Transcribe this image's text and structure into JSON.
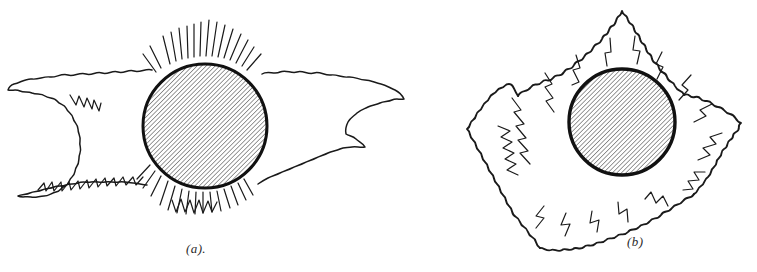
{
  "figure": {
    "background_color": "#ffffff",
    "ink_color": "#1a1a1a",
    "panels": [
      {
        "id": "a",
        "caption": "(a).",
        "disk": {
          "label": "hatched solar disk",
          "center_x": 205,
          "center_y": 126,
          "radius": 63,
          "hatch_angle_deg": 45,
          "hatch_spacing_px": 3,
          "fill_description": "diagonal line hatching"
        },
        "corona": {
          "shape": "elongated",
          "description": "wide flattened corona streamers extending far to left and right with short radial spikes above and below the disk",
          "extent_left_x": 8,
          "extent_right_x": 404,
          "extent_top_y": 18,
          "extent_bottom_y": 214
        }
      },
      {
        "id": "b",
        "caption": "(b)",
        "disk": {
          "label": "hatched solar disk",
          "center_x": 622,
          "center_y": 122,
          "radius": 54,
          "hatch_angle_deg": 45,
          "hatch_spacing_px": 3,
          "fill_description": "diagonal line hatching"
        },
        "corona": {
          "shape": "circular",
          "description": "roughly circular corona of wavy radial streamers surrounding the disk on all sides",
          "extent_left_x": 508,
          "extent_right_x": 742,
          "extent_top_y": 8,
          "extent_bottom_y": 232
        }
      }
    ]
  }
}
